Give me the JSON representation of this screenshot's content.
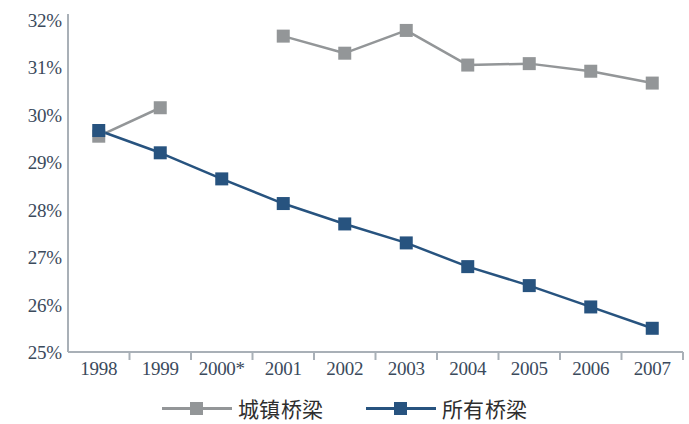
{
  "chart_data": {
    "type": "line",
    "title": "",
    "subtitle": "",
    "xlabel": "",
    "ylabel": "",
    "x": [
      "1998",
      "1999",
      "2000*",
      "2001",
      "2002",
      "2003",
      "2004",
      "2005",
      "2006",
      "2007"
    ],
    "categories": [
      "1998",
      "1999",
      "2000*",
      "2001",
      "2002",
      "2003",
      "2004",
      "2005",
      "2006",
      "2007"
    ],
    "ylim": [
      25,
      32
    ],
    "ytick_labels": [
      "32%",
      "31%",
      "30%",
      "29%",
      "28%",
      "27%",
      "26%",
      "25%"
    ],
    "ytick_values": [
      32,
      31,
      30,
      29,
      28,
      27,
      26,
      25
    ],
    "ytick_step": 1,
    "y_unit": "%",
    "grid": false,
    "legend_position": "bottom",
    "note": "2000 marked with asterisk; urban-bridges series has no data point for 2000",
    "series": [
      {
        "name": "城镇桥梁",
        "color": "#939698",
        "marker": "square",
        "values": [
          29.55,
          30.15,
          null,
          31.66,
          31.3,
          31.78,
          31.05,
          31.08,
          30.92,
          30.67
        ]
      },
      {
        "name": "所有桥梁",
        "color": "#27537f",
        "marker": "square",
        "values": [
          29.67,
          29.2,
          28.65,
          28.13,
          27.7,
          27.3,
          26.8,
          26.4,
          25.95,
          25.5
        ]
      }
    ]
  },
  "axes": {
    "axis_color": "#a9b0b7",
    "tick_label_color": "#3b4a5c"
  },
  "legend": {
    "items": [
      {
        "label": "城镇桥梁",
        "color": "#939698"
      },
      {
        "label": "所有桥梁",
        "color": "#27537f"
      }
    ]
  }
}
